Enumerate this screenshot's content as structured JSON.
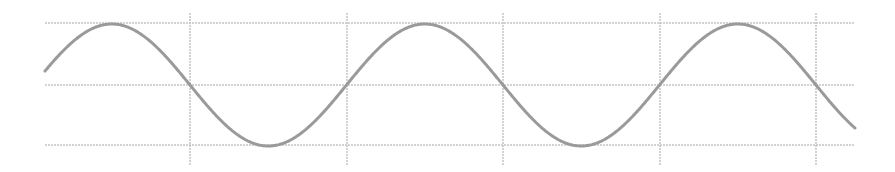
{
  "chart_data": {
    "type": "line",
    "title": "",
    "xlabel": "",
    "ylabel": "",
    "grid": true,
    "legend": null,
    "function": "sine",
    "series": [
      {
        "name": "sine wave",
        "amplitude": 1,
        "half_period_cycles": 5.25,
        "description": "Sine wave spanning ~2.6 periods, starting slightly above midline rising, ending descending below midline"
      }
    ],
    "y_levels": [
      1,
      0,
      -1
    ],
    "x_gridlines": 5,
    "colors": {
      "curve": "#9a9a9a",
      "grid": "#c4c4c4",
      "background": "#ffffff"
    },
    "layout": {
      "x_start": 45,
      "x_end": 855,
      "y_top": 23,
      "y_mid": 85,
      "y_bottom": 145,
      "vlines_x": [
        190,
        347,
        503,
        660,
        816
      ],
      "vline_y_top": 13,
      "vline_y_bottom": 165,
      "zero_crossing_x": 190,
      "half_period_px": 156.5
    }
  }
}
